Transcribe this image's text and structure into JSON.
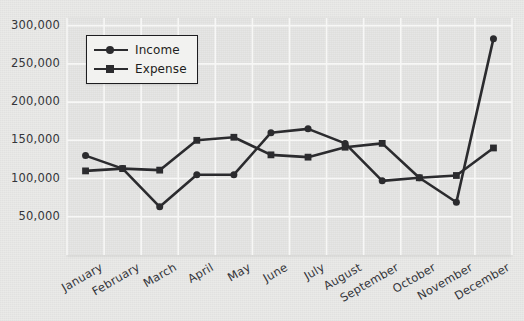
{
  "chart_data": {
    "type": "line",
    "title": "",
    "xlabel": "",
    "ylabel": "",
    "grid": true,
    "legend_position": "upper-left",
    "categories": [
      "January",
      "February",
      "March",
      "April",
      "May",
      "June",
      "July",
      "August",
      "September",
      "October",
      "November",
      "December"
    ],
    "x": [
      0,
      1,
      2,
      3,
      4,
      5,
      6,
      7,
      8,
      9,
      10,
      11
    ],
    "ylim": [
      0,
      310000
    ],
    "yticks": [
      50000,
      100000,
      150000,
      200000,
      250000,
      300000
    ],
    "ytick_labels": [
      "50,000",
      "100,000",
      "150,000",
      "200,000",
      "250,000",
      "300,000"
    ],
    "series": [
      {
        "name": "Income",
        "marker": "circle",
        "color": "#2b2b2e",
        "values": [
          130000,
          113000,
          63000,
          105000,
          105000,
          160000,
          165000,
          146000,
          97000,
          101000,
          69000,
          283000
        ]
      },
      {
        "name": "Expense",
        "marker": "square",
        "color": "#2b2b2e",
        "values": [
          110000,
          113000,
          111000,
          150000,
          154000,
          131000,
          128000,
          141000,
          146000,
          101000,
          104000,
          140000
        ]
      }
    ]
  },
  "legend": {
    "items": [
      {
        "label": "Income",
        "marker": "circle"
      },
      {
        "label": "Expense",
        "marker": "square"
      }
    ]
  },
  "style": {
    "plot_background": "#e6e6e4",
    "figure_background": "#eaeae8",
    "gridline_color": "#f7f7f6",
    "line_color": "#2b2b2e",
    "text_color": "#34353a"
  }
}
